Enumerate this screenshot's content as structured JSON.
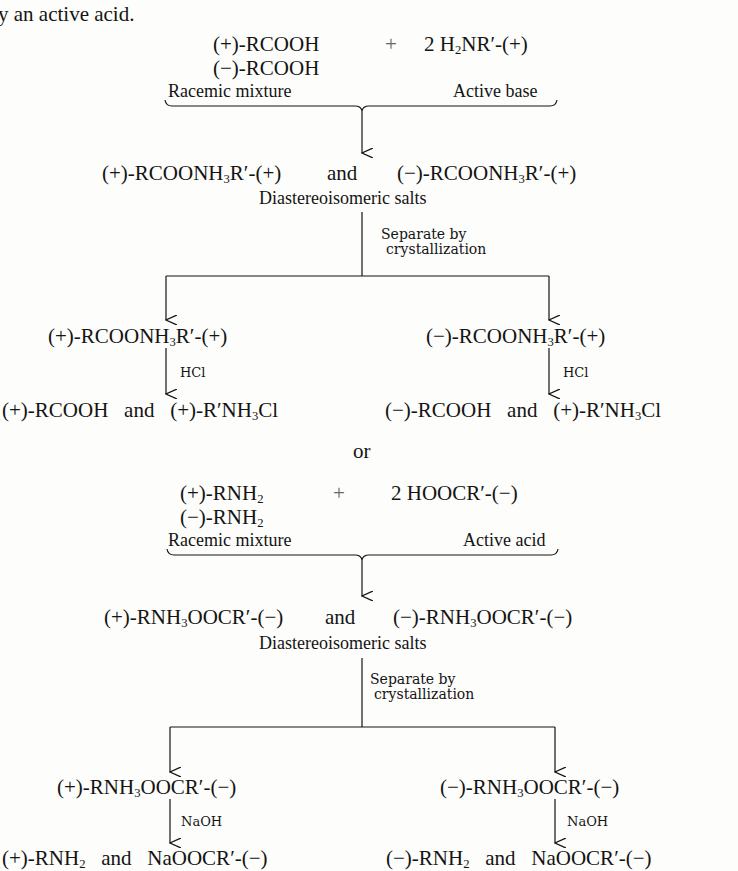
{
  "intro_text": "y an active acid.",
  "scheme1": {
    "reactant1_plus": {
      "prefix": "(+)-RCOOH"
    },
    "plus": "+",
    "reagent": {
      "coef": "2 H",
      "sub1": "2",
      "rest": "NR′-(+)"
    },
    "reactant1_minus": {
      "prefix": "(−)-RCOOH"
    },
    "label_left": "Racemic mixture",
    "label_right": "Active base",
    "salts": {
      "left": {
        "a": "(+)-RCOONH",
        "sub": "3",
        "b": "R′-(+)"
      },
      "and": "and",
      "right": {
        "a": "(−)-RCOONH",
        "sub": "3",
        "b": "R′-(+)"
      },
      "label": "Diastereoisomeric salts"
    },
    "separation": {
      "line1": "Separate by",
      "line2": "crystallization"
    },
    "branch_left": {
      "salt": {
        "a": "(+)-RCOONH",
        "sub": "3",
        "b": "R′-(+)"
      },
      "reagent": "HCl",
      "products": {
        "p1": "(+)-RCOOH",
        "and": "and",
        "p2a": "(+)-R′NH",
        "sub": "3",
        "p2b": "Cl"
      }
    },
    "branch_right": {
      "salt": {
        "a": "(−)-RCOONH",
        "sub": "3",
        "b": "R′-(+)"
      },
      "reagent": "HCl",
      "products": {
        "p1": "(−)-RCOOH",
        "and": "and",
        "p2a": "(+)-R′NH",
        "sub": "3",
        "p2b": "Cl"
      }
    }
  },
  "or_text": "or",
  "scheme2": {
    "reactant_plus": {
      "a": "(+)-RNH",
      "sub": "2"
    },
    "plus": "+",
    "reagent": "2 HOOCR′-(−)",
    "reactant_minus": {
      "a": "(−)-RNH",
      "sub": "2"
    },
    "label_left": "Racemic mixture",
    "label_right": "Active acid",
    "salts": {
      "left": {
        "a": "(+)-RNH",
        "sub": "3",
        "b": "OOCR′-(−)"
      },
      "and": "and",
      "right": {
        "a": "(−)-RNH",
        "sub": "3",
        "b": "OOCR′-(−)"
      },
      "label": "Diastereoisomeric salts"
    },
    "separation": {
      "line1": "Separate by",
      "line2": "crystallization"
    },
    "branch_left": {
      "salt": {
        "a": "(+)-RNH",
        "sub": "3",
        "b": "OOCR′-(−)"
      },
      "reagent": "NaOH",
      "products": {
        "p1a": "(+)-RNH",
        "sub": "2",
        "and": "and",
        "p2": "NaOOCR′-(−)"
      }
    },
    "branch_right": {
      "salt": {
        "a": "(−)-RNH",
        "sub": "3",
        "b": "OOCR′-(−)"
      },
      "reagent": "NaOH",
      "products": {
        "p1a": "(−)-RNH",
        "sub": "2",
        "and": "and",
        "p2": "NaOOCR′-(−)"
      }
    }
  },
  "colors": {
    "ink": "#141414",
    "paper": "#fdfdfb"
  }
}
